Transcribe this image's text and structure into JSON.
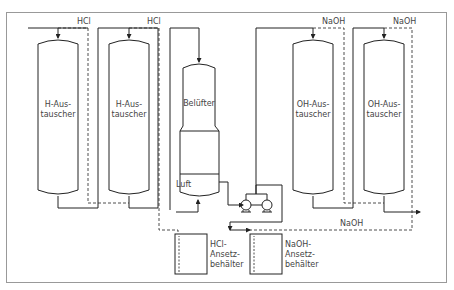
{
  "diagram": {
    "frame_color": "#999999",
    "line_color": "#222222",
    "vessels": [
      {
        "id": "h1",
        "label_l1": "H-Aus-",
        "label_l2": "tauscher"
      },
      {
        "id": "h2",
        "label_l1": "H-Aus-",
        "label_l2": "tauscher"
      },
      {
        "id": "bel",
        "label_l1": "Belüfter"
      },
      {
        "id": "oh1",
        "label_l1": "OH-Aus-",
        "label_l2": "tauscher"
      },
      {
        "id": "oh2",
        "label_l1": "OH-Aus-",
        "label_l2": "tauscher"
      }
    ],
    "tanks": [
      {
        "id": "hcl",
        "label_l1": "HCl-",
        "label_l2": "Ansetz-",
        "label_l3": "behälter"
      },
      {
        "id": "naoh",
        "label_l1": "NaOH-",
        "label_l2": "Ansetz-",
        "label_l3": "behälter"
      }
    ],
    "stream_labels": {
      "hcl1": "HCl",
      "hcl2": "HCl",
      "naoh1": "NaOH",
      "naoh2": "NaOH",
      "naoh_bottom": "NaOH",
      "luft": "Luft"
    }
  }
}
